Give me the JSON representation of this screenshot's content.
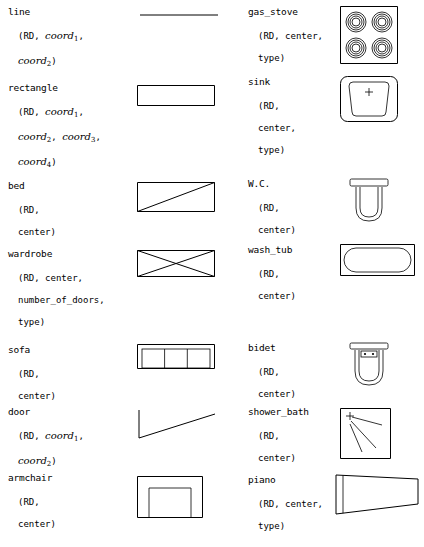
{
  "document": {
    "title": "Shape primitives reference table",
    "columns": 2,
    "width": 424,
    "height": 547,
    "ink_color": "#000000",
    "background_color": "#ffffff"
  },
  "left_column": [
    {
      "name": "line",
      "icon": "line-icon",
      "params": [
        [
          {
            "t": "(",
            "s": "plain"
          },
          {
            "t": "RD",
            "s": "mono"
          },
          {
            "t": ", ",
            "s": "plain"
          },
          {
            "t": "coord",
            "s": "it",
            "sub": "1"
          },
          {
            "t": ",",
            "s": "plain"
          }
        ],
        [
          {
            "t": "coord",
            "s": "it",
            "sub": "2"
          },
          {
            "t": ")",
            "s": "plain"
          }
        ]
      ]
    },
    {
      "name": "rectangle",
      "icon": "rectangle-icon",
      "params": [
        [
          {
            "t": "(",
            "s": "plain"
          },
          {
            "t": "RD",
            "s": "mono"
          },
          {
            "t": ", ",
            "s": "plain"
          },
          {
            "t": "coord",
            "s": "it",
            "sub": "1"
          },
          {
            "t": ",",
            "s": "plain"
          }
        ],
        [
          {
            "t": "coord",
            "s": "it",
            "sub": "2"
          },
          {
            "t": ", ",
            "s": "plain"
          },
          {
            "t": "coord",
            "s": "it",
            "sub": "3"
          },
          {
            "t": ",",
            "s": "plain"
          }
        ],
        [
          {
            "t": "coord",
            "s": "it",
            "sub": "4"
          },
          {
            "t": ")",
            "s": "plain"
          }
        ]
      ]
    },
    {
      "name": "bed",
      "icon": "bed-icon",
      "params": [
        [
          {
            "t": "(",
            "s": "plain"
          },
          {
            "t": "RD",
            "s": "mono"
          },
          {
            "t": ",",
            "s": "plain"
          }
        ],
        [
          {
            "t": "center)",
            "s": "plain"
          }
        ]
      ]
    },
    {
      "name": "wardrobe",
      "icon": "wardrobe-icon",
      "params": [
        [
          {
            "t": "(",
            "s": "plain"
          },
          {
            "t": "RD",
            "s": "mono"
          },
          {
            "t": ", center,",
            "s": "plain"
          }
        ],
        [
          {
            "t": "number_of_doors,",
            "s": "plain"
          }
        ],
        [
          {
            "t": "type)",
            "s": "plain"
          }
        ]
      ]
    },
    {
      "name": "sofa",
      "icon": "sofa-icon",
      "params": [
        [
          {
            "t": "(",
            "s": "plain"
          },
          {
            "t": "RD",
            "s": "mono"
          },
          {
            "t": ",",
            "s": "plain"
          }
        ],
        [
          {
            "t": "center)",
            "s": "plain"
          }
        ]
      ]
    },
    {
      "name": "door",
      "icon": "door-icon",
      "params": [
        [
          {
            "t": "(",
            "s": "plain"
          },
          {
            "t": "RD",
            "s": "mono"
          },
          {
            "t": ", ",
            "s": "plain"
          },
          {
            "t": "coord",
            "s": "it",
            "sub": "1"
          },
          {
            "t": ",",
            "s": "plain"
          }
        ],
        [
          {
            "t": "coord",
            "s": "it",
            "sub": "2"
          },
          {
            "t": ")",
            "s": "plain"
          }
        ]
      ]
    },
    {
      "name": "armchair",
      "icon": "armchair-icon",
      "params": [
        [
          {
            "t": "(",
            "s": "plain"
          },
          {
            "t": "RD",
            "s": "mono"
          },
          {
            "t": ",",
            "s": "plain"
          }
        ],
        [
          {
            "t": "center)",
            "s": "plain"
          }
        ]
      ]
    }
  ],
  "right_column": [
    {
      "name": "gas_stove",
      "icon": "gas-stove-icon",
      "params": [
        [
          {
            "t": "(",
            "s": "plain"
          },
          {
            "t": "RD",
            "s": "mono"
          },
          {
            "t": ", center,",
            "s": "plain"
          }
        ],
        [
          {
            "t": "type)",
            "s": "plain"
          }
        ]
      ]
    },
    {
      "name": "sink",
      "icon": "sink-icon",
      "params": [
        [
          {
            "t": "(",
            "s": "plain"
          },
          {
            "t": "RD",
            "s": "mono"
          },
          {
            "t": ",",
            "s": "plain"
          }
        ],
        [
          {
            "t": "center,",
            "s": "plain"
          }
        ],
        [
          {
            "t": "type)",
            "s": "plain"
          }
        ]
      ]
    },
    {
      "name": "W.C.",
      "icon": "wc-icon",
      "params": [
        [
          {
            "t": "(",
            "s": "plain"
          },
          {
            "t": "RD",
            "s": "mono"
          },
          {
            "t": ",",
            "s": "plain"
          }
        ],
        [
          {
            "t": "center)",
            "s": "plain"
          }
        ]
      ]
    },
    {
      "name": "wash_tub",
      "icon": "wash-tub-icon",
      "params": [
        [
          {
            "t": "(",
            "s": "plain"
          },
          {
            "t": "RD",
            "s": "mono"
          },
          {
            "t": ",",
            "s": "plain"
          }
        ],
        [
          {
            "t": "center)",
            "s": "plain"
          }
        ]
      ]
    },
    {
      "name": "bidet",
      "icon": "bidet-icon",
      "params": [
        [
          {
            "t": "(",
            "s": "plain"
          },
          {
            "t": "RD",
            "s": "mono"
          },
          {
            "t": ",",
            "s": "plain"
          }
        ],
        [
          {
            "t": "center)",
            "s": "plain"
          }
        ]
      ]
    },
    {
      "name": "shower_bath",
      "icon": "shower-bath-icon",
      "params": [
        [
          {
            "t": "(",
            "s": "plain"
          },
          {
            "t": "RD",
            "s": "mono"
          },
          {
            "t": ",",
            "s": "plain"
          }
        ],
        [
          {
            "t": "center)",
            "s": "plain"
          }
        ]
      ]
    },
    {
      "name": "piano",
      "icon": "piano-icon",
      "params": [
        [
          {
            "t": "(",
            "s": "plain"
          },
          {
            "t": "RD",
            "s": "mono"
          },
          {
            "t": ", center,",
            "s": "plain"
          }
        ],
        [
          {
            "t": "type)",
            "s": "plain"
          }
        ]
      ]
    }
  ]
}
